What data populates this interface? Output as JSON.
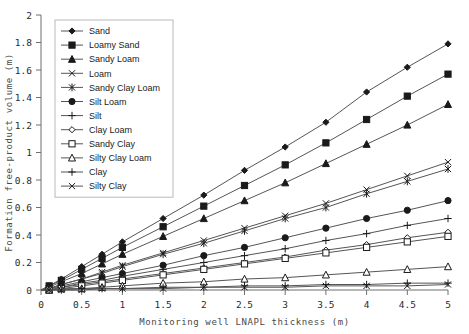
{
  "chart_data": {
    "type": "line",
    "title": "",
    "xlabel": "Monitoring well LNAPL thickness (m)",
    "ylabel": "Formation free-product volume (m)",
    "xlim": [
      0,
      5
    ],
    "ylim": [
      0,
      2
    ],
    "xticks": [
      "0",
      "0.5",
      "1",
      "1.5",
      "2",
      "2.5",
      "3",
      "3.5",
      "4",
      "4.5",
      "5"
    ],
    "yticks": [
      "0",
      "0.2",
      "0.4",
      "0.6",
      "0.8",
      "1",
      "1.2",
      "1.4",
      "1.6",
      "1.8",
      "2"
    ],
    "grid": false,
    "legend_position": "upper-left",
    "x": [
      0,
      0.1,
      0.25,
      0.5,
      0.75,
      1,
      1.5,
      2,
      2.5,
      3,
      3.5,
      4,
      4.5,
      5
    ],
    "series": [
      {
        "name": "Sand",
        "marker": "filled-diamond",
        "values": [
          0,
          0.03,
          0.08,
          0.17,
          0.26,
          0.35,
          0.52,
          0.69,
          0.87,
          1.04,
          1.22,
          1.44,
          1.62,
          1.79
        ]
      },
      {
        "name": "Loamy Sand",
        "marker": "filled-square",
        "values": [
          0,
          0.03,
          0.07,
          0.15,
          0.23,
          0.31,
          0.46,
          0.61,
          0.76,
          0.91,
          1.07,
          1.24,
          1.41,
          1.57
        ]
      },
      {
        "name": "Sandy Loam",
        "marker": "filled-triangle",
        "values": [
          0,
          0.02,
          0.06,
          0.12,
          0.19,
          0.26,
          0.39,
          0.52,
          0.65,
          0.78,
          0.92,
          1.06,
          1.2,
          1.35
        ]
      },
      {
        "name": "Loam",
        "marker": "cross-x",
        "values": [
          0,
          0.01,
          0.04,
          0.08,
          0.13,
          0.18,
          0.27,
          0.36,
          0.45,
          0.54,
          0.63,
          0.73,
          0.83,
          0.93
        ]
      },
      {
        "name": "Sandy Clay Loam",
        "marker": "star",
        "values": [
          0,
          0.01,
          0.04,
          0.08,
          0.12,
          0.17,
          0.26,
          0.34,
          0.43,
          0.52,
          0.6,
          0.7,
          0.79,
          0.88
        ]
      },
      {
        "name": "Silt Loam",
        "marker": "filled-circle",
        "values": [
          0,
          0.01,
          0.03,
          0.06,
          0.09,
          0.12,
          0.18,
          0.25,
          0.31,
          0.38,
          0.45,
          0.52,
          0.58,
          0.65
        ]
      },
      {
        "name": "Silt",
        "marker": "plus",
        "values": [
          0,
          0.01,
          0.02,
          0.05,
          0.07,
          0.1,
          0.15,
          0.2,
          0.25,
          0.3,
          0.36,
          0.41,
          0.47,
          0.52
        ]
      },
      {
        "name": "Clay Loam",
        "marker": "open-diamond",
        "values": [
          0,
          0.0,
          0.02,
          0.04,
          0.06,
          0.08,
          0.12,
          0.16,
          0.2,
          0.24,
          0.29,
          0.33,
          0.38,
          0.42
        ]
      },
      {
        "name": "Sandy Clay",
        "marker": "open-square",
        "values": [
          0,
          0.0,
          0.01,
          0.03,
          0.05,
          0.07,
          0.11,
          0.15,
          0.19,
          0.23,
          0.27,
          0.31,
          0.35,
          0.39
        ]
      },
      {
        "name": "Silty Clay Loam",
        "marker": "open-triangle",
        "values": [
          0,
          0.0,
          0.01,
          0.01,
          0.02,
          0.03,
          0.05,
          0.06,
          0.08,
          0.09,
          0.11,
          0.13,
          0.15,
          0.17
        ]
      },
      {
        "name": "Clay",
        "marker": "plus",
        "values": [
          0,
          0.0,
          0.0,
          0.01,
          0.01,
          0.01,
          0.02,
          0.02,
          0.03,
          0.03,
          0.04,
          0.04,
          0.05,
          0.05
        ]
      },
      {
        "name": "Silty Clay",
        "marker": "cross-x",
        "values": [
          0,
          0.0,
          0.0,
          0.0,
          0.01,
          0.01,
          0.01,
          0.02,
          0.02,
          0.02,
          0.03,
          0.03,
          0.03,
          0.04
        ]
      }
    ]
  }
}
